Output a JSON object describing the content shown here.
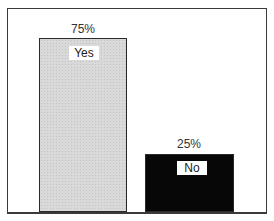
{
  "chart_data": {
    "type": "bar",
    "title": "",
    "xlabel": "",
    "ylabel": "",
    "categories": [
      "Yes",
      "No"
    ],
    "values": [
      75,
      25
    ],
    "value_labels": [
      "75%",
      "25%"
    ],
    "ylim": [
      0,
      100
    ],
    "grid": false,
    "legend": null,
    "colors": [
      "#d9d9d9",
      "#070707"
    ]
  },
  "bars": [
    {
      "category": "Yes",
      "value_label": "75%"
    },
    {
      "category": "No",
      "value_label": "25%"
    }
  ]
}
